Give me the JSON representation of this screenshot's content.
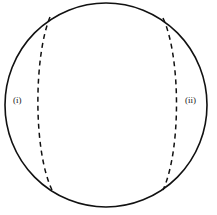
{
  "figure": {
    "background_color": "#ffffff",
    "stroke_color": "#111111",
    "label_color": "#1a1a1a",
    "canvas": {
      "width": 217,
      "height": 215
    },
    "outline": {
      "shape_name": "circle",
      "center_x": 106,
      "center_y": 105,
      "radius_x": 101,
      "radius_y": 102,
      "stroke_width": 1.6,
      "style": "solid"
    },
    "arcs": [
      {
        "id": "left-meridian",
        "style": "dashed",
        "dash_pattern": "5,4",
        "stroke_width": 1.5,
        "start_x": 50,
        "start_y": 17,
        "end_x": 52,
        "end_y": 190,
        "bulge_x": 38,
        "bulge_direction": "left"
      },
      {
        "id": "right-meridian",
        "style": "dashed",
        "dash_pattern": "5,4",
        "stroke_width": 1.5,
        "start_x": 163,
        "start_y": 18,
        "end_x": 163,
        "end_y": 190,
        "bulge_x": 176,
        "bulge_direction": "right"
      }
    ],
    "labels": [
      {
        "id": "region-i",
        "text": "(i)",
        "x": 13,
        "y": 96
      },
      {
        "id": "region-ii",
        "text": "(ii)",
        "x": 185,
        "y": 96
      }
    ]
  }
}
